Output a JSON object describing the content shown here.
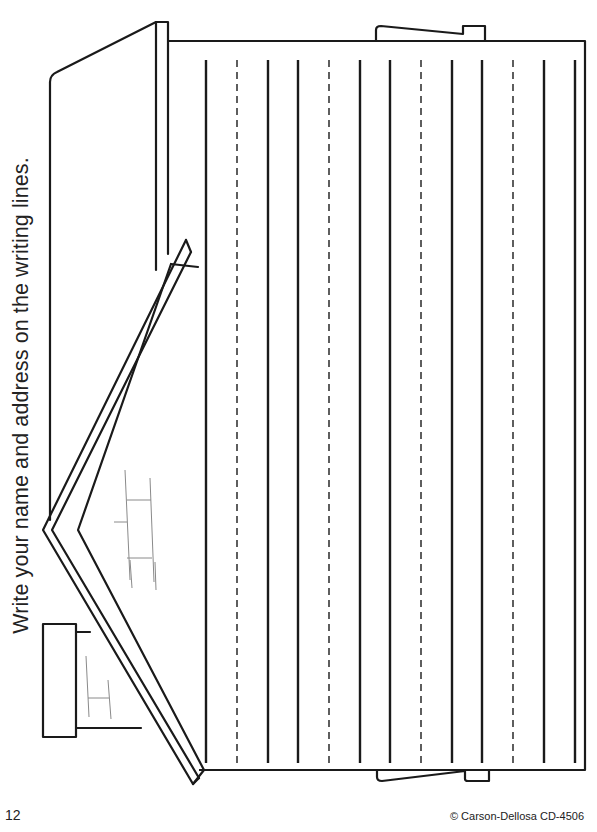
{
  "worksheet": {
    "instruction": "Write your name and address on the writing lines.",
    "page_number": "12",
    "copyright": "© Carson-Dellosa CD-4506"
  },
  "illustration": {
    "subject": "house-icon",
    "orientation": "rotated-90-ccw",
    "writing_lines": {
      "count": 13,
      "x_positions": [
        206,
        237,
        268,
        298,
        329,
        360,
        390,
        421,
        452,
        482,
        513,
        544,
        575
      ],
      "styles": [
        "solid",
        "dashed",
        "solid",
        "solid",
        "dashed",
        "solid",
        "solid",
        "dashed",
        "solid",
        "solid",
        "dashed",
        "solid",
        "solid"
      ],
      "top_y": 60,
      "bottom_y": 763
    },
    "line_color": "#1a1a1a",
    "sketch_color": "#8a8a8a"
  }
}
